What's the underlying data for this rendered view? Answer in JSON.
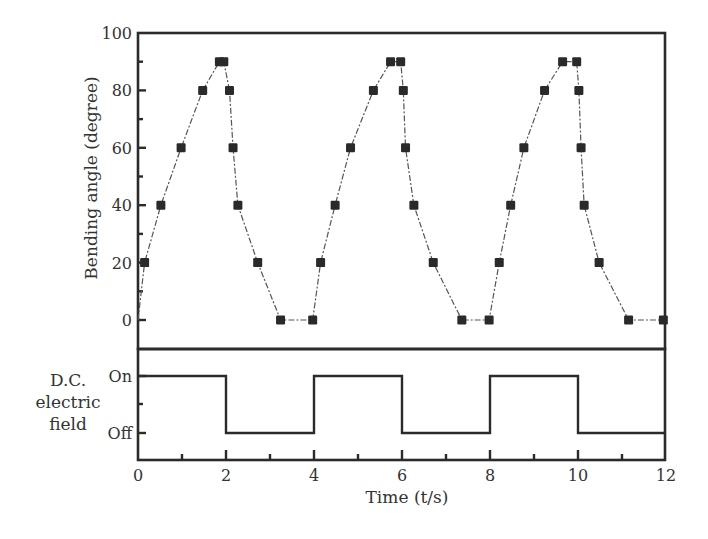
{
  "chart_data": [
    {
      "type": "scatter",
      "panel": "top",
      "title": "",
      "xlabel": "Time (t/s)",
      "ylabel": "Bending angle (degree)",
      "xlim": [
        0,
        12
      ],
      "ylim": [
        -10,
        100
      ],
      "x_ticks": [
        "0",
        "2",
        "4",
        "6",
        "8",
        "10",
        "12"
      ],
      "y_ticks": [
        "0",
        "20",
        "40",
        "60",
        "80",
        "100"
      ],
      "grid": false,
      "legend": null,
      "marker": "square",
      "line_style": "dash-dot",
      "series": [
        {
          "name": "Bending angle",
          "x": [
            0.0,
            0.15,
            0.52,
            0.98,
            1.47,
            1.85,
            1.95,
            2.08,
            2.16,
            2.27,
            2.72,
            3.24,
            3.97,
            4.15,
            4.48,
            4.83,
            5.35,
            5.74,
            5.97,
            6.03,
            6.08,
            6.27,
            6.71,
            7.36,
            7.98,
            8.21,
            8.47,
            8.77,
            9.24,
            9.65,
            9.97,
            10.02,
            10.07,
            10.14,
            10.48,
            11.15,
            11.94
          ],
          "y": [
            0,
            20,
            40,
            60,
            80,
            90,
            90,
            80,
            60,
            40,
            20,
            0,
            0,
            20,
            40,
            60,
            80,
            90,
            90,
            80,
            60,
            40,
            20,
            0,
            0,
            20,
            40,
            60,
            80,
            90,
            90,
            80,
            60,
            40,
            20,
            0,
            0
          ]
        }
      ]
    },
    {
      "type": "line",
      "panel": "bottom",
      "title": "",
      "xlabel": "Time (t/s)",
      "ylabel": "D.C. electric field",
      "xlim": [
        0,
        12
      ],
      "y_ticks": [
        "Off",
        "On"
      ],
      "grid": false,
      "legend": null,
      "step": true,
      "series": [
        {
          "name": "D.C. electric field",
          "x": [
            0,
            2,
            2,
            4,
            4,
            6,
            6,
            8,
            8,
            10,
            10,
            12
          ],
          "y": [
            "On",
            "On",
            "Off",
            "Off",
            "On",
            "On",
            "Off",
            "Off",
            "On",
            "On",
            "Off",
            "Off"
          ]
        }
      ]
    }
  ],
  "labels": {
    "y_top": "Bending angle (degree)",
    "y_bottom_line1": "D.C.",
    "y_bottom_line2": "electric",
    "y_bottom_line3": "field",
    "x": "Time (t/s)",
    "on": "On",
    "off": "Off",
    "x_ticks": [
      "0",
      "2",
      "4",
      "6",
      "8",
      "10",
      "12"
    ],
    "y_ticks": [
      "0",
      "20",
      "40",
      "60",
      "80",
      "100"
    ]
  }
}
